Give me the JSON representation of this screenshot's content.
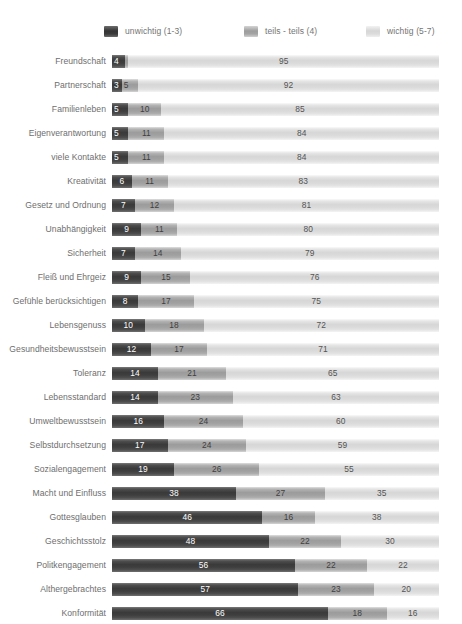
{
  "legend": {
    "items": [
      {
        "label": "unwichtig (1-3)",
        "swatch": "dark-swatch-icon",
        "color": "#3a3a3a"
      },
      {
        "label": "teils - teils (4)",
        "swatch": "mid-swatch-icon",
        "color": "#9c9c9c"
      },
      {
        "label": "wichtig (5-7)",
        "swatch": "light-swatch-icon",
        "color": "#d7d7d7"
      }
    ]
  },
  "chart_data": {
    "type": "bar",
    "orientation": "horizontal",
    "stacked": true,
    "normalized_to_percent": true,
    "title": "",
    "subtitle": "",
    "xlabel": "",
    "ylabel": "",
    "xlim": [
      0,
      100
    ],
    "grid": false,
    "legend_position": "top",
    "series": [
      {
        "name": "unwichtig (1-3)",
        "color": "#3a3a3a",
        "values": [
          4,
          3,
          5,
          5,
          5,
          6,
          7,
          9,
          7,
          9,
          8,
          10,
          12,
          14,
          14,
          16,
          17,
          19,
          38,
          46,
          48,
          56,
          57,
          66
        ]
      },
      {
        "name": "teils - teils (4)",
        "color": "#9c9c9c",
        "values": [
          1,
          5,
          10,
          11,
          11,
          11,
          12,
          11,
          14,
          15,
          17,
          18,
          17,
          21,
          23,
          24,
          24,
          26,
          27,
          16,
          22,
          22,
          23,
          18
        ]
      },
      {
        "name": "wichtig (5-7)",
        "color": "#d7d7d7",
        "values": [
          95,
          92,
          85,
          84,
          84,
          83,
          81,
          80,
          79,
          76,
          75,
          72,
          71,
          65,
          63,
          60,
          59,
          55,
          35,
          38,
          30,
          22,
          20,
          16
        ]
      }
    ],
    "categories": [
      "Freundschaft",
      "Partnerschaft",
      "Familienleben",
      "Eigenverantwortung",
      "viele Kontakte",
      "Kreativität",
      "Gesetz und Ordnung",
      "Unabhängigkeit",
      "Sicherheit",
      "Fleiß und Ehrgeiz",
      "Gefühle berücksichtigen",
      "Lebensgenuss",
      "Gesundheitsbewusstsein",
      "Toleranz",
      "Lebensstandard",
      "Umweltbewusstsein",
      "Selbstdurchsetzung",
      "Sozialengagement",
      "Macht und Einfluss",
      "Gottesglauben",
      "Geschichtsstolz",
      "Politkengagement",
      "Althergebrachtes",
      "Konformität"
    ]
  },
  "rows": [
    {
      "label": "Freundschaft",
      "values": [
        4,
        1,
        95
      ],
      "labels": [
        "4",
        "",
        "95"
      ]
    },
    {
      "label": "Partnerschaft",
      "values": [
        3,
        5,
        92
      ],
      "labels": [
        "3",
        "5",
        "92"
      ]
    },
    {
      "label": "Familienleben",
      "values": [
        5,
        10,
        85
      ],
      "labels": [
        "5",
        "10",
        "85"
      ]
    },
    {
      "label": "Eigenverantwortung",
      "values": [
        5,
        11,
        84
      ],
      "labels": [
        "5",
        "11",
        "84"
      ]
    },
    {
      "label": "viele Kontakte",
      "values": [
        5,
        11,
        84
      ],
      "labels": [
        "5",
        "11",
        "84"
      ]
    },
    {
      "label": "Kreativität",
      "values": [
        6,
        11,
        83
      ],
      "labels": [
        "6",
        "11",
        "83"
      ]
    },
    {
      "label": "Gesetz und Ordnung",
      "values": [
        7,
        12,
        81
      ],
      "labels": [
        "7",
        "12",
        "81"
      ]
    },
    {
      "label": "Unabhängigkeit",
      "values": [
        9,
        11,
        80
      ],
      "labels": [
        "9",
        "11",
        "80"
      ]
    },
    {
      "label": "Sicherheit",
      "values": [
        7,
        14,
        79
      ],
      "labels": [
        "7",
        "14",
        "79"
      ]
    },
    {
      "label": "Fleiß und Ehrgeiz",
      "values": [
        9,
        15,
        76
      ],
      "labels": [
        "9",
        "15",
        "76"
      ]
    },
    {
      "label": "Gefühle berücksichtigen",
      "values": [
        8,
        17,
        75
      ],
      "labels": [
        "8",
        "17",
        "75"
      ]
    },
    {
      "label": "Lebensgenuss",
      "values": [
        10,
        18,
        72
      ],
      "labels": [
        "10",
        "18",
        "72"
      ]
    },
    {
      "label": "Gesundheitsbewusstsein",
      "values": [
        12,
        17,
        71
      ],
      "labels": [
        "12",
        "17",
        "71"
      ]
    },
    {
      "label": "Toleranz",
      "values": [
        14,
        21,
        65
      ],
      "labels": [
        "14",
        "21",
        "65"
      ]
    },
    {
      "label": "Lebensstandard",
      "values": [
        14,
        23,
        63
      ],
      "labels": [
        "14",
        "23",
        "63"
      ]
    },
    {
      "label": "Umweltbewusstsein",
      "values": [
        16,
        24,
        60
      ],
      "labels": [
        "16",
        "24",
        "60"
      ]
    },
    {
      "label": "Selbstdurchsetzung",
      "values": [
        17,
        24,
        59
      ],
      "labels": [
        "17",
        "24",
        "59"
      ]
    },
    {
      "label": "Sozialengagement",
      "values": [
        19,
        26,
        55
      ],
      "labels": [
        "19",
        "26",
        "55"
      ]
    },
    {
      "label": "Macht und Einfluss",
      "values": [
        38,
        27,
        35
      ],
      "labels": [
        "38",
        "27",
        "35"
      ]
    },
    {
      "label": "Gottesglauben",
      "values": [
        46,
        16,
        38
      ],
      "labels": [
        "46",
        "16",
        "38"
      ]
    },
    {
      "label": "Geschichtsstolz",
      "values": [
        48,
        22,
        30
      ],
      "labels": [
        "48",
        "22",
        "30"
      ]
    },
    {
      "label": "Politkengagement",
      "values": [
        56,
        22,
        22
      ],
      "labels": [
        "56",
        "22",
        "22"
      ]
    },
    {
      "label": "Althergebrachtes",
      "values": [
        57,
        23,
        20
      ],
      "labels": [
        "57",
        "23",
        "20"
      ]
    },
    {
      "label": "Konformität",
      "values": [
        66,
        18,
        16
      ],
      "labels": [
        "66",
        "18",
        "16"
      ]
    }
  ]
}
